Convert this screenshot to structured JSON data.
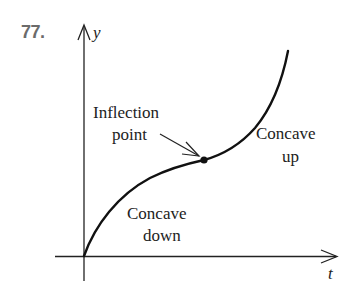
{
  "problem_number": "77.",
  "axes": {
    "x_label": "t",
    "y_label": "y"
  },
  "annotations": {
    "inflection_line1": "Inflection",
    "inflection_line2": "point",
    "concave_up_line1": "Concave",
    "concave_up_line2": "up",
    "concave_down_line1": "Concave",
    "concave_down_line2": "down"
  },
  "colors": {
    "curve": "#111111",
    "axes": "#222222",
    "number_label": "#6b6b6b"
  }
}
